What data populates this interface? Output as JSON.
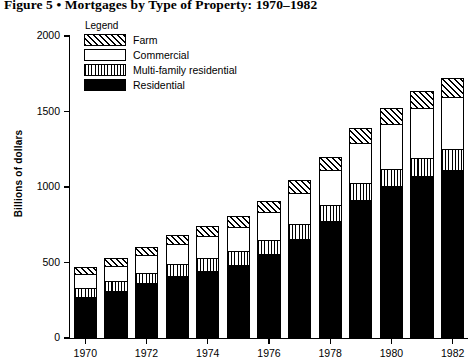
{
  "figure": {
    "title": "Figure 5 • Mortgages by Type of Property: 1970–1982"
  },
  "legend": {
    "title": "Legend",
    "items": [
      {
        "label": "Farm",
        "pattern": "diagonal-hatch",
        "key": "farm"
      },
      {
        "label": "Commercial",
        "pattern": "empty-white",
        "key": "commercial"
      },
      {
        "label": "Multi-family residential",
        "pattern": "vertical-stripes",
        "key": "multifamily"
      },
      {
        "label": "Residential",
        "pattern": "solid-black",
        "key": "residential"
      }
    ]
  },
  "axes": {
    "ylabel": "Billions of dollars",
    "yticks": [
      0,
      500,
      1000,
      1500,
      2000
    ],
    "ytick_labels": [
      "0",
      "500",
      "1000",
      "1500",
      "2000"
    ],
    "ylim": [
      0,
      2000
    ],
    "xtick_labels": [
      "1970",
      "1972",
      "1974",
      "1976",
      "1978",
      "1980",
      "1982"
    ],
    "xtick_years": [
      1970,
      1972,
      1974,
      1976,
      1978,
      1980,
      1982
    ]
  },
  "chart_data": {
    "type": "bar",
    "stacked": true,
    "title": "Figure 5 • Mortgages by Type of Property: 1970–1982",
    "xlabel": "",
    "ylabel": "Billions of dollars",
    "ylim": [
      0,
      2000
    ],
    "grid": false,
    "legend_position": "top-left-inside",
    "categories": [
      "1970",
      "1971",
      "1972",
      "1973",
      "1974",
      "1975",
      "1976",
      "1977",
      "1978",
      "1979",
      "1980",
      "1981",
      "1982"
    ],
    "series": [
      {
        "name": "Residential",
        "values": [
          280,
          320,
          370,
          420,
          450,
          490,
          560,
          660,
          780,
          920,
          1010,
          1080,
          1120
        ]
      },
      {
        "name": "Multi-family residential",
        "values": [
          60,
          65,
          70,
          80,
          85,
          90,
          95,
          100,
          105,
          110,
          115,
          120,
          135
        ]
      },
      {
        "name": "Commercial",
        "values": [
          90,
          100,
          115,
          130,
          150,
          165,
          185,
          210,
          235,
          270,
          300,
          330,
          350
        ]
      },
      {
        "name": "Farm",
        "values": [
          40,
          45,
          50,
          55,
          60,
          65,
          70,
          75,
          80,
          90,
          95,
          105,
          115
        ]
      }
    ],
    "totals": [
      470,
      530,
      605,
      685,
      745,
      810,
      910,
      1045,
      1200,
      1390,
      1520,
      1635,
      1720
    ]
  },
  "bars": [
    {
      "year": "1970",
      "residential": 280,
      "multifamily": 60,
      "commercial": 90,
      "farm": 40,
      "total": 470
    },
    {
      "year": "1971",
      "residential": 320,
      "multifamily": 65,
      "commercial": 100,
      "farm": 45,
      "total": 530
    },
    {
      "year": "1972",
      "residential": 370,
      "multifamily": 70,
      "commercial": 115,
      "farm": 50,
      "total": 605
    },
    {
      "year": "1973",
      "residential": 420,
      "multifamily": 80,
      "commercial": 130,
      "farm": 55,
      "total": 685
    },
    {
      "year": "1974",
      "residential": 450,
      "multifamily": 85,
      "commercial": 150,
      "farm": 60,
      "total": 745
    },
    {
      "year": "1975",
      "residential": 490,
      "multifamily": 90,
      "commercial": 165,
      "farm": 65,
      "total": 810
    },
    {
      "year": "1976",
      "residential": 560,
      "multifamily": 95,
      "commercial": 185,
      "farm": 70,
      "total": 910
    },
    {
      "year": "1977",
      "residential": 660,
      "multifamily": 100,
      "commercial": 210,
      "farm": 75,
      "total": 1045
    },
    {
      "year": "1978",
      "residential": 780,
      "multifamily": 105,
      "commercial": 235,
      "farm": 80,
      "total": 1200
    },
    {
      "year": "1979",
      "residential": 920,
      "multifamily": 110,
      "commercial": 270,
      "farm": 90,
      "total": 1390
    },
    {
      "year": "1980",
      "residential": 1010,
      "multifamily": 115,
      "commercial": 300,
      "farm": 95,
      "total": 1520
    },
    {
      "year": "1981",
      "residential": 1080,
      "multifamily": 120,
      "commercial": 330,
      "farm": 105,
      "total": 1635
    },
    {
      "year": "1982",
      "residential": 1120,
      "multifamily": 135,
      "commercial": 350,
      "farm": 115,
      "total": 1720
    }
  ]
}
